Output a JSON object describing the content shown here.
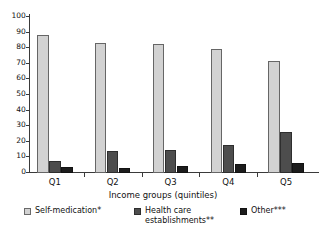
{
  "chart_data": {
    "type": "bar",
    "title": "",
    "xlabel": "Income groups (quintiles)",
    "ylabel": "",
    "categories": [
      "Q1",
      "Q2",
      "Q3",
      "Q4",
      "Q5"
    ],
    "ylim": [
      0,
      100
    ],
    "yticks": [
      0,
      10,
      20,
      30,
      40,
      50,
      60,
      70,
      80,
      90,
      100
    ],
    "ytick_labels": [
      "0",
      "10",
      "20",
      "30",
      "40",
      "50",
      "60",
      "70",
      "80",
      "90",
      "100"
    ],
    "grid": false,
    "legend_position": "bottom",
    "series": [
      {
        "name": "Self-medication*",
        "color": "#d2d2d2",
        "values": [
          88.5,
          83.5,
          82.5,
          79.5,
          71.5
        ]
      },
      {
        "name": "Health care\nestablishments**",
        "color": "#4d4d4d",
        "values": [
          7.5,
          14,
          15,
          18,
          26
        ]
      },
      {
        "name": "Other***",
        "color": "#1c1c1c",
        "values": [
          4,
          3.5,
          4.5,
          6,
          6.5
        ]
      }
    ]
  }
}
